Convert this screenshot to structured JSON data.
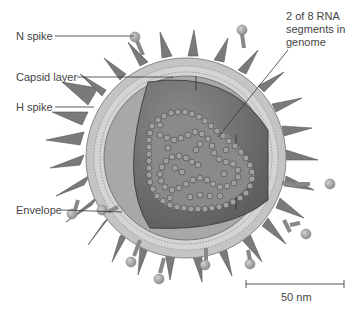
{
  "diagram": {
    "labels": {
      "n_spike": "N spike",
      "capsid_layer": "Capsid layer",
      "h_spike": "H spike",
      "envelope": "Envelope",
      "rna_line1": "2 of 8 RNA",
      "rna_line2": "segments in",
      "rna_line3": "genome"
    },
    "scale_bar": {
      "label": "50 nm"
    }
  },
  "colors": {
    "background": "#ffffff",
    "spike_dark": "#6e6e6e",
    "spike_light": "#9a9a9a",
    "envelope": "#c8c8c8",
    "membrane": "#b0b0b0",
    "capsid": "#a8a8a8",
    "interior": "#7c7c7c",
    "rna": "#9c9c9c",
    "text": "#444444"
  }
}
